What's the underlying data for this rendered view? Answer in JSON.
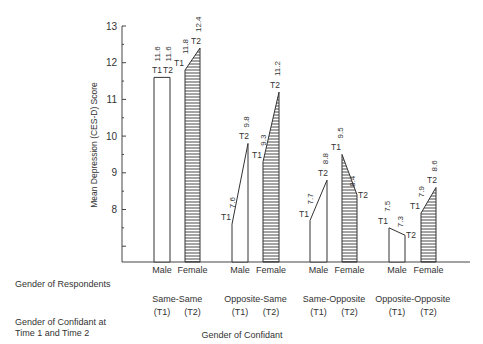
{
  "chart_data": {
    "type": "bar",
    "title": "",
    "ylabel": "Mean Depression (CES-D) Score",
    "xlabel": "Gender of Confidant",
    "ylim": [
      6.6,
      13
    ],
    "yticks": [
      8,
      9,
      10,
      11,
      12,
      13
    ],
    "grid": false,
    "legend": null,
    "row_labels": {
      "respondents": "Gender of Respondents",
      "confidant": "Gender of Confidant at Time 1 and Time 2"
    },
    "groups": [
      {
        "name": "Same-Same",
        "t1": "(T1)",
        "t2": "(T2)",
        "bars": [
          {
            "gender": "Male",
            "T1": 11.6,
            "T2": 11.6,
            "fill": "open"
          },
          {
            "gender": "Female",
            "T1": 11.8,
            "T2": 12.4,
            "fill": "hatched"
          }
        ]
      },
      {
        "name": "Opposite-Same",
        "t1": "(T1)",
        "t2": "(T2)",
        "bars": [
          {
            "gender": "Male",
            "T1": 7.6,
            "T2": 9.8,
            "fill": "open"
          },
          {
            "gender": "Female",
            "T1": 9.3,
            "T2": 11.2,
            "fill": "hatched"
          }
        ]
      },
      {
        "name": "Same-Opposite",
        "t1": "(T1)",
        "t2": "(T2)",
        "bars": [
          {
            "gender": "Male",
            "T1": 7.7,
            "T2": 8.8,
            "fill": "open"
          },
          {
            "gender": "Female",
            "T1": 9.5,
            "T2": 8.4,
            "fill": "hatched"
          }
        ]
      },
      {
        "name": "Opposite-Opposite",
        "t1": "(T1)",
        "t2": "(T2)",
        "bars": [
          {
            "gender": "Male",
            "T1": 7.5,
            "T2": 7.3,
            "fill": "open"
          },
          {
            "gender": "Female",
            "T1": 7.9,
            "T2": 8.6,
            "fill": "hatched"
          }
        ]
      }
    ],
    "series": [
      {
        "name": "Male T1",
        "values": [
          11.6,
          7.6,
          7.7,
          7.5
        ]
      },
      {
        "name": "Male T2",
        "values": [
          11.6,
          9.8,
          8.8,
          7.3
        ]
      },
      {
        "name": "Female T1",
        "values": [
          11.8,
          9.3,
          9.5,
          7.9
        ]
      },
      {
        "name": "Female T2",
        "values": [
          12.4,
          11.2,
          8.4,
          8.6
        ]
      }
    ],
    "categories": [
      "Same-Same",
      "Opposite-Same",
      "Same-Opposite",
      "Opposite-Opposite"
    ],
    "point_labels": {
      "t1": "T1",
      "t2": "T2"
    }
  }
}
